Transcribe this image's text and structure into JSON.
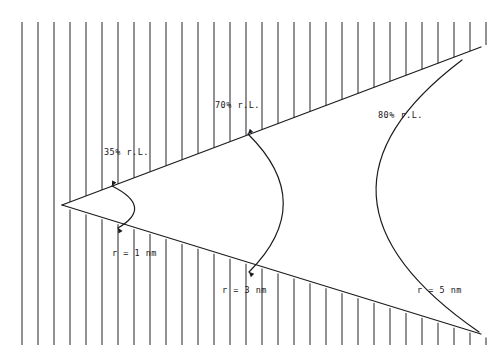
{
  "figure": {
    "background_color": "#ffffff",
    "ink_color": "#1c1c20",
    "hatch_color": "#2e2e33",
    "width": 496,
    "height": 363
  },
  "chart_data": {
    "type": "diagram",
    "title": "",
    "subtitle": "",
    "xlabel": "",
    "ylabel": "",
    "apex": {
      "x": 62,
      "y": 205
    },
    "cone_edges": [
      {
        "name": "upper-edge",
        "from": {
          "x": 62,
          "y": 205
        },
        "to": {
          "x": 481,
          "y": 47
        }
      },
      {
        "name": "lower-edge",
        "from": {
          "x": 62,
          "y": 205
        },
        "to": {
          "x": 481,
          "y": 334
        }
      }
    ],
    "series": [
      {
        "name": "35% r.L.",
        "percent_label": "35% r.L.",
        "radius_label": "r = 1 nm",
        "radius_nm": 1,
        "percent": 35,
        "arc_top": {
          "x": 112,
          "y": 186
        },
        "arc_bottom": {
          "x": 118,
          "y": 228
        },
        "arc_bulge_x": 133
      },
      {
        "name": "70% r.L.",
        "percent_label": "70% r.L.",
        "radius_label": "r = 3 nm",
        "radius_nm": 3,
        "percent": 70,
        "arc_top": {
          "x": 248,
          "y": 134
        },
        "arc_bottom": {
          "x": 249,
          "y": 272
        },
        "arc_bulge_x": 283
      },
      {
        "name": "80% r.L.",
        "percent_label": "80% r.L.",
        "radius_label": "r = 5 nm",
        "radius_nm": 5,
        "percent": 80,
        "arc_top": {
          "x": 462,
          "y": 60
        },
        "arc_bottom": {
          "x": 479,
          "y": 332
        },
        "arc_bulge_x": 372
      }
    ],
    "hatching": {
      "orientation": "vertical",
      "spacing_px": 16,
      "upper_band_top_y": 22,
      "lower_band_bottom_y": 345,
      "note": "Vertical hatch lines fill the region above the upper cone edge and below the lower cone edge."
    }
  },
  "labels": {
    "percent_35": "35% r.L.",
    "percent_70": "70% r.L.",
    "percent_80": "80% r.L.",
    "radius_1": "r = 1 nm",
    "radius_3": "r = 3 nm",
    "radius_5": "r = 5 nm"
  }
}
